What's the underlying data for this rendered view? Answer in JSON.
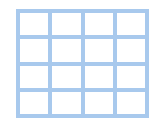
{
  "grid": {
    "rows": 4,
    "columns": 4,
    "line_color": "#a8c9ed",
    "cell_color": "#ffffff"
  }
}
